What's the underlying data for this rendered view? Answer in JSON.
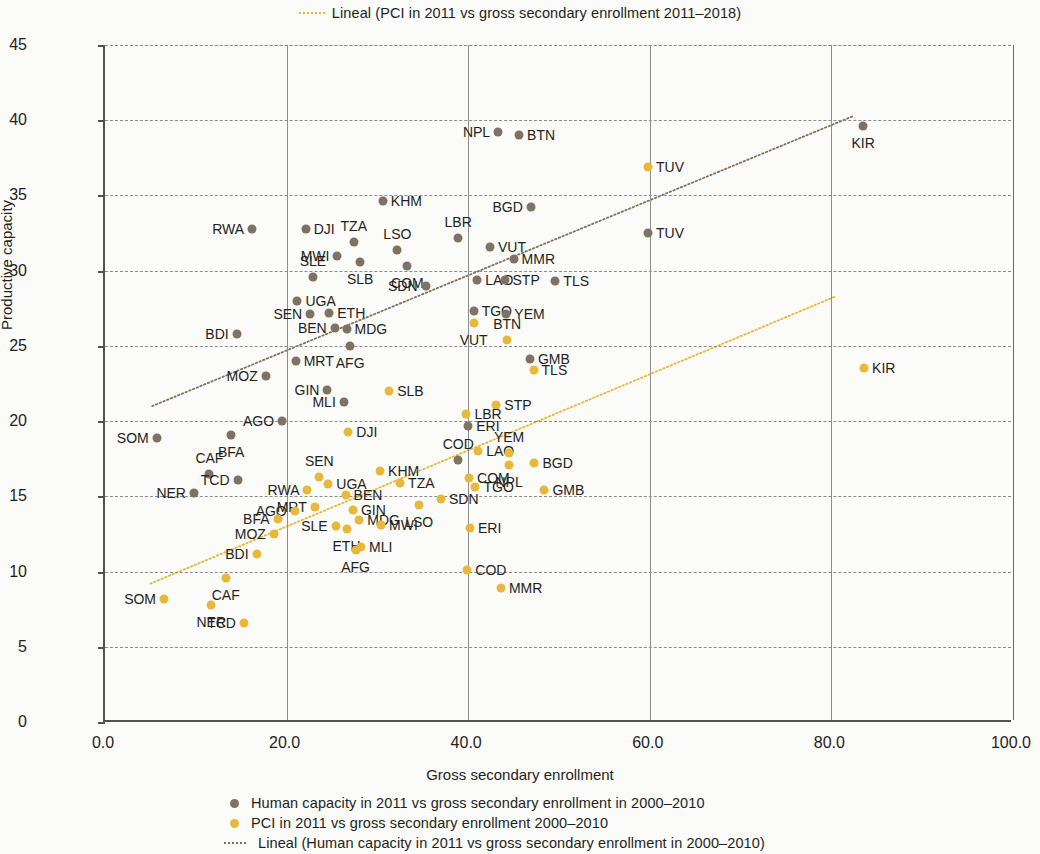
{
  "top_legend": {
    "marker": "dotted-line-yellow",
    "label": "Lineal (PCI in 2011 vs gross secondary enrollment 2011–2018)"
  },
  "axes": {
    "x_title": "Gross secondary enrollment",
    "y_title": "Productive capacity",
    "x_ticks": [
      "0.0",
      "20.0",
      "40.0",
      "60.0",
      "80.0",
      "100.0"
    ],
    "y_ticks": [
      "0",
      "5",
      "10",
      "15",
      "20",
      "25",
      "30",
      "35",
      "40",
      "45"
    ]
  },
  "legend": {
    "items": [
      {
        "marker": "dot",
        "color": "#7d7263",
        "label": "Human capacity in 2011 vs gross secondary enrollment in 2000–2010"
      },
      {
        "marker": "dot",
        "color": "#e8b83c",
        "label": "PCI in 2011 vs gross secondary enrollment 2000–2010"
      },
      {
        "marker": "dotted-line",
        "color": "#7d7263",
        "label": "Lineal (Human capacity in 2011 vs gross secondary enrollment in 2000–2010)"
      }
    ]
  },
  "colors": {
    "human": "#7d7263",
    "pci": "#e8b83c",
    "axis": "#55524e",
    "grid": "#8d8d8d",
    "background": "#fbfbf9"
  },
  "chart_data": {
    "type": "scatter",
    "title": "",
    "xlabel": "Gross secondary enrollment",
    "ylabel": "Productive capacity",
    "xlim": [
      0,
      100
    ],
    "ylim": [
      0,
      45
    ],
    "xticks": [
      0,
      20,
      40,
      60,
      80,
      100
    ],
    "yticks": [
      0,
      5,
      10,
      15,
      20,
      25,
      30,
      35,
      40,
      45
    ],
    "grid": true,
    "legend_position": "bottom",
    "series": [
      {
        "name": "Human capacity in 2011 vs gross secondary enrollment in 2000–2010",
        "color": "#7d7263",
        "points": [
          {
            "label": "NPL",
            "x": 43.3,
            "y": 39.2,
            "lp": "left"
          },
          {
            "label": "BTN",
            "x": 45.6,
            "y": 39.0,
            "lp": "right"
          },
          {
            "label": "BGD",
            "x": 46.9,
            "y": 34.2,
            "lp": "left"
          },
          {
            "label": "KHM",
            "x": 30.6,
            "y": 34.6,
            "lp": "right"
          },
          {
            "label": "RWA",
            "x": 16.2,
            "y": 32.8,
            "lp": "left"
          },
          {
            "label": "DJI",
            "x": 22.1,
            "y": 32.8,
            "lp": "right"
          },
          {
            "label": "TZA",
            "x": 27.4,
            "y": 31.9,
            "lp": "above"
          },
          {
            "label": "LBR",
            "x": 38.9,
            "y": 32.2,
            "lp": "above"
          },
          {
            "label": "LSO",
            "x": 32.2,
            "y": 31.4,
            "lp": "above"
          },
          {
            "label": "VUT",
            "x": 42.4,
            "y": 31.6,
            "lp": "right"
          },
          {
            "label": "MMR",
            "x": 45.0,
            "y": 30.8,
            "lp": "right"
          },
          {
            "label": "MWI",
            "x": 25.6,
            "y": 31.0,
            "lp": "left"
          },
          {
            "label": "SLB",
            "x": 28.1,
            "y": 30.6,
            "lp": "below"
          },
          {
            "label": "COM",
            "x": 33.3,
            "y": 30.3,
            "lp": "below"
          },
          {
            "label": "SLE",
            "x": 22.9,
            "y": 29.6,
            "lp": "above"
          },
          {
            "label": "SDN",
            "x": 35.3,
            "y": 29.0,
            "lp": "left"
          },
          {
            "label": "LAO",
            "x": 41.0,
            "y": 29.4,
            "lp": "right"
          },
          {
            "label": "STP",
            "x": 44.0,
            "y": 29.4,
            "lp": "right"
          },
          {
            "label": "TLS",
            "x": 49.6,
            "y": 29.3,
            "lp": "right"
          },
          {
            "label": "UGA",
            "x": 21.2,
            "y": 28.0,
            "lp": "right"
          },
          {
            "label": "SEN",
            "x": 22.6,
            "y": 27.1,
            "lp": "left"
          },
          {
            "label": "ETH",
            "x": 24.7,
            "y": 27.2,
            "lp": "right"
          },
          {
            "label": "TGO",
            "x": 40.6,
            "y": 27.3,
            "lp": "right"
          },
          {
            "label": "YEM",
            "x": 44.2,
            "y": 27.1,
            "lp": "right"
          },
          {
            "label": "BEN",
            "x": 25.3,
            "y": 26.2,
            "lp": "left"
          },
          {
            "label": "MDG",
            "x": 26.6,
            "y": 26.1,
            "lp": "right"
          },
          {
            "label": "BDI",
            "x": 14.5,
            "y": 25.8,
            "lp": "left"
          },
          {
            "label": "GMB",
            "x": 46.8,
            "y": 24.1,
            "lp": "right"
          },
          {
            "label": "AFG",
            "x": 27.0,
            "y": 25.0,
            "lp": "below"
          },
          {
            "label": "MRT",
            "x": 21.0,
            "y": 24.0,
            "lp": "right"
          },
          {
            "label": "MOZ",
            "x": 17.7,
            "y": 23.0,
            "lp": "left"
          },
          {
            "label": "GIN",
            "x": 24.5,
            "y": 22.1,
            "lp": "left"
          },
          {
            "label": "MLI",
            "x": 26.3,
            "y": 21.3,
            "lp": "left"
          },
          {
            "label": "ERI",
            "x": 40.0,
            "y": 19.7,
            "lp": "right"
          },
          {
            "label": "AGO",
            "x": 19.5,
            "y": 20.0,
            "lp": "left"
          },
          {
            "label": "SOM",
            "x": 5.7,
            "y": 18.9,
            "lp": "left"
          },
          {
            "label": "BFA",
            "x": 13.9,
            "y": 19.1,
            "lp": "below"
          },
          {
            "label": "CAF",
            "x": 11.5,
            "y": 16.5,
            "lp": "above"
          },
          {
            "label": "TCD",
            "x": 14.6,
            "y": 16.1,
            "lp": "left"
          },
          {
            "label": "NER",
            "x": 9.8,
            "y": 15.2,
            "lp": "left"
          },
          {
            "label": "COD",
            "x": 38.9,
            "y": 17.4,
            "lp": "above"
          },
          {
            "label": "KIR",
            "x": 83.5,
            "y": 39.6,
            "lp": "below"
          },
          {
            "label": "TUV",
            "x": 59.8,
            "y": 32.5,
            "lp": "right"
          }
        ]
      },
      {
        "name": "PCI in 2011 vs gross secondary enrollment 2000–2010",
        "color": "#e8b83c",
        "points": [
          {
            "label": "TUV",
            "x": 59.8,
            "y": 36.9,
            "lp": "right"
          },
          {
            "label": "KIR",
            "x": 83.6,
            "y": 23.5,
            "lp": "right"
          },
          {
            "label": "VUT",
            "x": 40.6,
            "y": 26.5,
            "lp": "below"
          },
          {
            "label": "BTN",
            "x": 44.3,
            "y": 25.4,
            "lp": "above"
          },
          {
            "label": "TLS",
            "x": 47.2,
            "y": 23.4,
            "lp": "right"
          },
          {
            "label": "SLB",
            "x": 31.3,
            "y": 22.0,
            "lp": "right"
          },
          {
            "label": "STP",
            "x": 43.1,
            "y": 21.1,
            "lp": "right"
          },
          {
            "label": "LBR",
            "x": 39.8,
            "y": 20.5,
            "lp": "right"
          },
          {
            "label": "DJI",
            "x": 26.8,
            "y": 19.3,
            "lp": "right"
          },
          {
            "label": "LAO",
            "x": 41.1,
            "y": 18.0,
            "lp": "right"
          },
          {
            "label": "YEM",
            "x": 44.5,
            "y": 17.9,
            "lp": "above"
          },
          {
            "label": "NPL",
            "x": 44.5,
            "y": 17.1,
            "lp": "below"
          },
          {
            "label": "BGD",
            "x": 47.3,
            "y": 17.2,
            "lp": "right"
          },
          {
            "label": "COM",
            "x": 40.1,
            "y": 16.2,
            "lp": "right"
          },
          {
            "label": "TGO",
            "x": 40.8,
            "y": 15.6,
            "lp": "right"
          },
          {
            "label": "GMB",
            "x": 48.4,
            "y": 15.4,
            "lp": "right"
          },
          {
            "label": "KHM",
            "x": 30.3,
            "y": 16.7,
            "lp": "right"
          },
          {
            "label": "TZA",
            "x": 32.5,
            "y": 15.9,
            "lp": "right"
          },
          {
            "label": "SDN",
            "x": 37.0,
            "y": 14.8,
            "lp": "right"
          },
          {
            "label": "LSO",
            "x": 34.6,
            "y": 14.4,
            "lp": "below"
          },
          {
            "label": "ERI",
            "x": 40.2,
            "y": 12.9,
            "lp": "right"
          },
          {
            "label": "COD",
            "x": 39.9,
            "y": 10.1,
            "lp": "right"
          },
          {
            "label": "MMR",
            "x": 43.6,
            "y": 8.9,
            "lp": "right"
          },
          {
            "label": "SEN",
            "x": 23.6,
            "y": 16.3,
            "lp": "above"
          },
          {
            "label": "UGA",
            "x": 24.6,
            "y": 15.8,
            "lp": "right"
          },
          {
            "label": "RWA",
            "x": 22.3,
            "y": 15.4,
            "lp": "left"
          },
          {
            "label": "BEN",
            "x": 26.5,
            "y": 15.1,
            "lp": "right"
          },
          {
            "label": "GIN",
            "x": 27.3,
            "y": 14.1,
            "lp": "right"
          },
          {
            "label": "MRT",
            "x": 23.1,
            "y": 14.3,
            "lp": "left"
          },
          {
            "label": "AGO",
            "x": 20.9,
            "y": 14.0,
            "lp": "left"
          },
          {
            "label": "BFA",
            "x": 19.0,
            "y": 13.5,
            "lp": "left"
          },
          {
            "label": "MDG",
            "x": 28.0,
            "y": 13.4,
            "lp": "right"
          },
          {
            "label": "ETH",
            "x": 26.6,
            "y": 12.8,
            "lp": "below"
          },
          {
            "label": "SLE",
            "x": 25.4,
            "y": 13.0,
            "lp": "left"
          },
          {
            "label": "MWI",
            "x": 30.4,
            "y": 13.1,
            "lp": "right"
          },
          {
            "label": "MOZ",
            "x": 18.6,
            "y": 12.5,
            "lp": "left"
          },
          {
            "label": "MLI",
            "x": 28.2,
            "y": 11.6,
            "lp": "right"
          },
          {
            "label": "AFG",
            "x": 27.6,
            "y": 11.4,
            "lp": "below"
          },
          {
            "label": "BDI",
            "x": 16.7,
            "y": 11.2,
            "lp": "left"
          },
          {
            "label": "SOM",
            "x": 6.5,
            "y": 8.2,
            "lp": "left"
          },
          {
            "label": "CAF",
            "x": 13.3,
            "y": 9.6,
            "lp": "below"
          },
          {
            "label": "NER",
            "x": 11.7,
            "y": 7.8,
            "lp": "below"
          },
          {
            "label": "TCD",
            "x": 15.3,
            "y": 6.6,
            "lp": "left"
          }
        ]
      }
    ],
    "trendlines": [
      {
        "name": "Lineal (Human capacity in 2011 vs gross secondary enrollment in 2000–2010)",
        "color": "#7d7263",
        "x1": 5.2,
        "y1": 21.0,
        "x2": 82.5,
        "y2": 40.3
      },
      {
        "name": "Lineal (PCI in 2011 vs gross secondary enrollment 2011–2018)",
        "color": "#e8b83c",
        "x1": 5.0,
        "y1": 9.2,
        "x2": 80.5,
        "y2": 28.3
      }
    ]
  }
}
